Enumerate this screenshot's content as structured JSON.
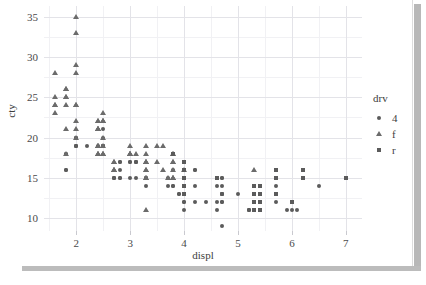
{
  "chart_data": {
    "type": "scatter",
    "title": "",
    "xlabel": "displ",
    "ylabel": "cty",
    "xlim": [
      1.4,
      7.3
    ],
    "ylim": [
      8.4,
      36.3
    ],
    "grid": true,
    "x_ticks": [
      2,
      3,
      4,
      5,
      6,
      7
    ],
    "y_ticks": [
      10,
      15,
      20,
      25,
      30,
      35
    ],
    "x_minor_ticks": [
      1.5,
      2.5,
      3.5,
      4.5,
      5.5,
      6.5
    ],
    "y_minor_ticks": [
      12.5,
      17.5,
      22.5,
      27.5,
      32.5
    ],
    "legend": {
      "title": "drv",
      "position": "right",
      "entries": [
        {
          "label": "4",
          "shape": "circle",
          "color": "#5b5b5b"
        },
        {
          "label": "f",
          "shape": "triangle",
          "color": "#6b6b6b"
        },
        {
          "label": "r",
          "shape": "square",
          "color": "#5b5b5b"
        }
      ]
    },
    "point_color": "#5b5b5b",
    "series": [
      {
        "name": "4",
        "shape": "circle",
        "points": [
          [
            1.8,
            18
          ],
          [
            1.8,
            16
          ],
          [
            2.0,
            20
          ],
          [
            2.0,
            19
          ],
          [
            2.8,
            15
          ],
          [
            2.8,
            17
          ],
          [
            3.1,
            17
          ],
          [
            1.8,
            18
          ],
          [
            1.8,
            16
          ],
          [
            2.0,
            20
          ],
          [
            2.0,
            19
          ],
          [
            2.8,
            15
          ],
          [
            2.8,
            17
          ],
          [
            3.1,
            15
          ],
          [
            3.1,
            17
          ],
          [
            2.8,
            16
          ],
          [
            3.1,
            17
          ],
          [
            4.2,
            16
          ],
          [
            5.3,
            14
          ],
          [
            5.3,
            11
          ],
          [
            5.7,
            15
          ],
          [
            6.0,
            11
          ],
          [
            5.7,
            14
          ],
          [
            5.7,
            13
          ],
          [
            6.5,
            14
          ],
          [
            5.7,
            12
          ],
          [
            2.5,
            21
          ],
          [
            2.5,
            19
          ],
          [
            3.3,
            14
          ],
          [
            3.3,
            15
          ],
          [
            4.0,
            14
          ],
          [
            4.0,
            12
          ],
          [
            4.7,
            14
          ],
          [
            4.7,
            13
          ],
          [
            4.7,
            13
          ],
          [
            5.2,
            11
          ],
          [
            5.2,
            11
          ],
          [
            3.9,
            13
          ],
          [
            3.9,
            13
          ],
          [
            4.7,
            13
          ],
          [
            4.7,
            15
          ],
          [
            4.7,
            13
          ],
          [
            4.7,
            9
          ],
          [
            5.2,
            11
          ],
          [
            5.9,
            11
          ],
          [
            4.0,
            11
          ],
          [
            4.0,
            13
          ],
          [
            4.6,
            11
          ],
          [
            5.4,
            11
          ],
          [
            2.7,
            15
          ],
          [
            2.7,
            15
          ],
          [
            2.7,
            15
          ],
          [
            3.0,
            15
          ],
          [
            3.7,
            15
          ],
          [
            4.0,
            15
          ],
          [
            4.7,
            15
          ],
          [
            4.7,
            12
          ],
          [
            4.7,
            12
          ],
          [
            5.7,
            13
          ],
          [
            6.1,
            11
          ],
          [
            4.0,
            12
          ],
          [
            4.2,
            12
          ],
          [
            4.4,
            12
          ],
          [
            4.6,
            12
          ],
          [
            5.4,
            12
          ],
          [
            5.4,
            12
          ],
          [
            4.0,
            14
          ],
          [
            4.0,
            13
          ],
          [
            4.6,
            14
          ],
          [
            4.2,
            14
          ],
          [
            3.7,
            14
          ],
          [
            3.8,
            14
          ],
          [
            3.8,
            14
          ],
          [
            3.8,
            16
          ],
          [
            4.2,
            16
          ],
          [
            5.0,
            13
          ],
          [
            2.5,
            19
          ],
          [
            2.5,
            19
          ],
          [
            3.3,
            15
          ],
          [
            3.3,
            15
          ],
          [
            2.4,
            19
          ],
          [
            3.0,
            17
          ],
          [
            3.0,
            17
          ],
          [
            4.0,
            17
          ],
          [
            4.0,
            16
          ],
          [
            4.0,
            16
          ],
          [
            4.0,
            15
          ],
          [
            4.0,
            15
          ],
          [
            4.0,
            13
          ],
          [
            4.0,
            13
          ],
          [
            2.0,
            20
          ],
          [
            2.0,
            19
          ],
          [
            2.5,
            20
          ],
          [
            2.2,
            19
          ],
          [
            2.5,
            19
          ]
        ]
      },
      {
        "name": "f",
        "shape": "triangle",
        "points": [
          [
            1.8,
            21
          ],
          [
            1.8,
            18
          ],
          [
            2.0,
            21
          ],
          [
            2.0,
            22
          ],
          [
            2.0,
            20
          ],
          [
            2.4,
            19
          ],
          [
            2.4,
            18
          ],
          [
            2.5,
            23
          ],
          [
            2.5,
            20
          ],
          [
            2.5,
            18
          ],
          [
            3.5,
            17
          ],
          [
            3.6,
            16
          ],
          [
            2.4,
            21
          ],
          [
            2.4,
            22
          ],
          [
            3.0,
            18
          ],
          [
            3.3,
            18
          ],
          [
            3.3,
            16
          ],
          [
            3.8,
            18
          ],
          [
            3.8,
            17
          ],
          [
            3.8,
            18
          ],
          [
            4.0,
            16
          ],
          [
            3.7,
            15
          ],
          [
            3.8,
            15
          ],
          [
            3.8,
            15
          ],
          [
            5.3,
            16
          ],
          [
            2.4,
            21
          ],
          [
            2.4,
            22
          ],
          [
            3.1,
            18
          ],
          [
            3.5,
            19
          ],
          [
            3.6,
            19
          ],
          [
            2.4,
            19
          ],
          [
            3.0,
            19
          ],
          [
            3.3,
            19
          ],
          [
            3.3,
            17
          ],
          [
            3.3,
            17
          ],
          [
            3.8,
            17
          ],
          [
            1.6,
            28
          ],
          [
            1.6,
            24
          ],
          [
            1.6,
            25
          ],
          [
            1.6,
            23
          ],
          [
            1.6,
            24
          ],
          [
            1.8,
            26
          ],
          [
            1.8,
            25
          ],
          [
            2.0,
            24
          ],
          [
            2.4,
            21
          ],
          [
            2.4,
            21
          ],
          [
            2.5,
            22
          ],
          [
            2.5,
            22
          ],
          [
            3.3,
            11
          ],
          [
            2.0,
            35
          ],
          [
            2.0,
            33
          ],
          [
            2.0,
            29
          ],
          [
            2.0,
            28
          ],
          [
            2.7,
            17
          ],
          [
            2.7,
            17
          ],
          [
            2.7,
            16
          ],
          [
            2.7,
            16
          ],
          [
            2.7,
            16
          ],
          [
            3.0,
            18
          ],
          [
            3.0,
            18
          ],
          [
            3.0,
            18
          ],
          [
            3.3,
            17
          ],
          [
            3.3,
            16
          ],
          [
            3.3,
            15
          ],
          [
            3.3,
            15
          ],
          [
            3.8,
            16
          ],
          [
            3.8,
            15
          ],
          [
            2.5,
            18
          ],
          [
            2.5,
            18
          ],
          [
            1.8,
            24
          ],
          [
            1.8,
            26
          ],
          [
            1.8,
            25
          ],
          [
            2.0,
            24
          ],
          [
            2.5,
            22
          ],
          [
            2.4,
            19
          ],
          [
            2.4,
            18
          ],
          [
            2.4,
            18
          ],
          [
            2.5,
            19
          ]
        ]
      },
      {
        "name": "r",
        "shape": "square",
        "points": [
          [
            3.8,
            18
          ],
          [
            4.0,
            17
          ],
          [
            4.0,
            16
          ],
          [
            4.0,
            15
          ],
          [
            4.0,
            14
          ],
          [
            4.0,
            13
          ],
          [
            4.6,
            15
          ],
          [
            5.4,
            14
          ],
          [
            5.4,
            13
          ],
          [
            5.4,
            12
          ],
          [
            5.4,
            11
          ],
          [
            5.7,
            16
          ],
          [
            5.7,
            15
          ],
          [
            5.7,
            13
          ],
          [
            6.2,
            16
          ],
          [
            6.2,
            15
          ],
          [
            6.0,
            12
          ],
          [
            7.0,
            15
          ],
          [
            5.3,
            14
          ],
          [
            5.3,
            13
          ],
          [
            5.3,
            12
          ],
          [
            5.3,
            11
          ]
        ]
      }
    ]
  }
}
